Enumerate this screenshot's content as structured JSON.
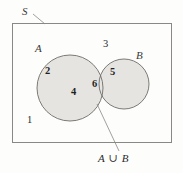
{
  "figure": {
    "type": "venn-diagram",
    "background_color": "#fdfdfc",
    "region_fill_color": "#e6e4e1",
    "stroke_color": "#6e6c68",
    "text_color": "#2b2b2b"
  },
  "universal_set": {
    "label": "S",
    "box": {
      "x": 12,
      "y": 23,
      "width": 160,
      "height": 120
    }
  },
  "sets": [
    {
      "id": "A",
      "label": "A",
      "label_pos": {
        "x": 38,
        "y": 49
      },
      "circle": {
        "cx": 70,
        "cy": 88,
        "r": 33
      },
      "members_visible": [
        "2",
        "4"
      ]
    },
    {
      "id": "B",
      "label": "B",
      "label_pos": {
        "x": 139,
        "y": 56
      },
      "circle": {
        "cx": 124,
        "cy": 84,
        "r": 25
      },
      "members_visible": [
        "5",
        "6"
      ]
    }
  ],
  "elements": [
    {
      "value": "2",
      "x": 48,
      "y": 72,
      "region": "A-only",
      "style": "bold"
    },
    {
      "value": "4",
      "x": 74,
      "y": 93,
      "region": "A-only",
      "style": "bold"
    },
    {
      "value": "6",
      "x": 95,
      "y": 85,
      "region": "A-union-B-junction",
      "style": "bold"
    },
    {
      "value": "5",
      "x": 113,
      "y": 73,
      "region": "B-only",
      "style": "bold"
    },
    {
      "value": "3",
      "x": 105,
      "y": 45,
      "region": "outside-circles-in-S",
      "style": "plain"
    },
    {
      "value": "1",
      "x": 29,
      "y": 120,
      "region": "outside-circles-in-S",
      "style": "plain"
    }
  ],
  "callouts": [
    {
      "name": "universal-set-callout",
      "text": "S",
      "text_pos": {
        "x": 25,
        "y": 13
      },
      "leader": {
        "x1": 32,
        "y1": 14,
        "x2": 44,
        "y2": 24
      }
    },
    {
      "name": "union-callout",
      "text": "A ∪ B",
      "text_pos": {
        "x": 100,
        "y": 160
      },
      "leader": {
        "x1": 96,
        "y1": 103,
        "x2": 120,
        "y2": 152
      }
    }
  ],
  "caption": {
    "union_symbol": "∪",
    "union_label": "A ∪ B"
  }
}
